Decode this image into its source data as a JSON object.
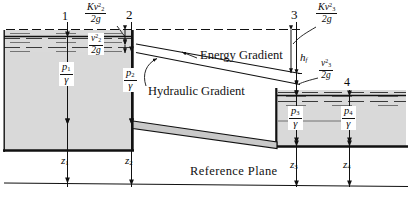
{
  "figure": {
    "type": "hydraulics-energy-gradient-diagram",
    "background_color": "#ffffff",
    "water_fill_color": "#d7d7d7",
    "pipe_fill_color": "#c9c9c9",
    "line_color": "#111111"
  },
  "stations": [
    {
      "id": "1",
      "label": "1"
    },
    {
      "id": "2",
      "label": "2"
    },
    {
      "id": "3",
      "label": "3"
    },
    {
      "id": "4",
      "label": "4"
    }
  ],
  "head_terms": {
    "entrance_loss": {
      "numerator": "Kv",
      "num_sub": "2",
      "num_sup": "2",
      "denominator": "2g"
    },
    "velocity_head_2": {
      "numerator": "v",
      "num_sub": "2",
      "num_sup": "2",
      "denominator": "2g"
    },
    "exit_loss": {
      "numerator": "Kv",
      "num_sub": "3",
      "num_sup": "2",
      "denominator": "2g"
    },
    "velocity_head_3": {
      "numerator": "v",
      "num_sub": "3",
      "num_sup": "2",
      "denominator": "2g"
    },
    "friction_loss": {
      "symbol": "h",
      "sub": "f"
    }
  },
  "pressure_heads": [
    {
      "numerator": "p",
      "num_sub": "1",
      "denominator": "γ"
    },
    {
      "numerator": "p",
      "num_sub": "2",
      "denominator": "γ"
    },
    {
      "numerator": "p",
      "num_sub": "3",
      "denominator": "γ"
    },
    {
      "numerator": "p",
      "num_sub": "4",
      "denominator": "γ"
    }
  ],
  "elevation_heads": [
    {
      "symbol": "z",
      "sub": "1"
    },
    {
      "symbol": "z",
      "sub": "2"
    },
    {
      "symbol": "z",
      "sub": "3"
    },
    {
      "symbol": "z",
      "sub": "4"
    }
  ],
  "gradient_labels": {
    "energy": "Energy Gradient",
    "hydraulic": "Hydraulic Gradient"
  },
  "datum_label": "Reference Plane"
}
